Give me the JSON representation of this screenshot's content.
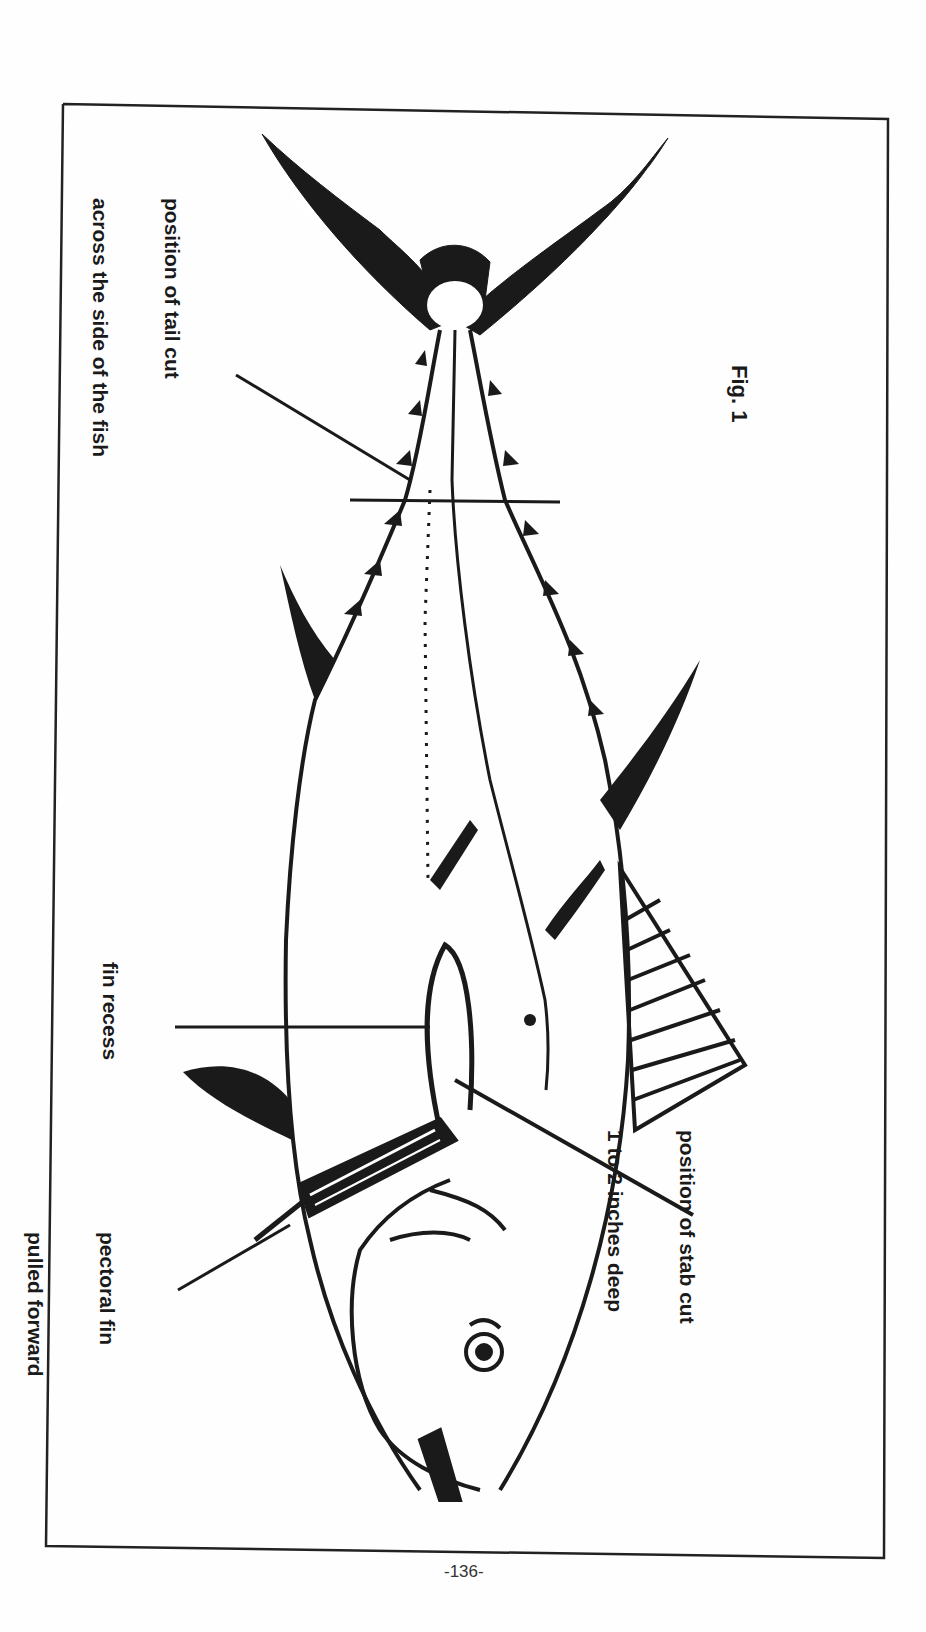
{
  "figure": {
    "label": "Fig. 1",
    "orientation": "rotated 90 degrees, tail at top, head at bottom"
  },
  "annotations": {
    "tail_cut": {
      "line1": "position of tail cut",
      "line2": "across the side of the fish"
    },
    "fin_recess": {
      "line1": "fin recess"
    },
    "pectoral_fin": {
      "line1": "pectoral fin",
      "line2": "pulled forward"
    },
    "stab_cut": {
      "line1": "position of stab cut",
      "line2": "1 to 2 inches deep"
    }
  },
  "page": {
    "number": "-136-"
  },
  "colors": {
    "ink": "#1a1a1a",
    "paper": "#fefefe",
    "frame": "#222222"
  }
}
